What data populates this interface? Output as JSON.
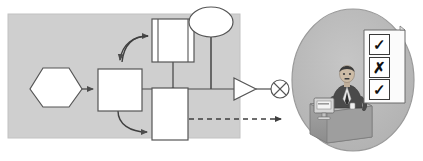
{
  "figure": {
    "background_color": "#ffffff",
    "panel_fill": "#cfcfcf",
    "panel_stroke": "#c4c4c4",
    "shape_fill": "#ffffff",
    "shape_stroke": "#555555",
    "connector_color": "#4d4d4d",
    "scene_fill": "#b9b9b9",
    "scene_stroke": "#8f8f8f"
  },
  "panel": {
    "name": "process-panel",
    "x": 8,
    "y": 14,
    "width": 232,
    "height": 124
  },
  "nodes": {
    "start_hexagon": {
      "label": "",
      "shape": "hexagon",
      "x": 30,
      "y": 68,
      "width": 52,
      "height": 38
    },
    "process_box": {
      "label": "",
      "shape": "rectangle",
      "x": 98,
      "y": 69,
      "width": 44,
      "height": 42
    },
    "document_box": {
      "label": "",
      "shape": "bordered-rectangle",
      "x": 152,
      "y": 19,
      "width": 42,
      "height": 43
    },
    "lower_box": {
      "label": "",
      "shape": "rectangle",
      "x": 152,
      "y": 88,
      "width": 36,
      "height": 52
    },
    "ellipse_node": {
      "label": "",
      "shape": "ellipse",
      "cx": 211,
      "cy": 22,
      "rx": 22,
      "ry": 15
    },
    "triangle_node": {
      "label": "",
      "shape": "triangle",
      "x": 234,
      "y": 78,
      "width": 22,
      "height": 22
    },
    "crossed_circle": {
      "label": "",
      "shape": "circle-with-x",
      "cx": 280,
      "cy": 89,
      "r": 9
    }
  },
  "connectors": [
    {
      "name": "hexagon-to-process",
      "style": "solid",
      "arrow": true
    },
    {
      "name": "process-to-document",
      "style": "solid-curved",
      "arrow": true
    },
    {
      "name": "document-feedback-to-process",
      "style": "solid-curved",
      "arrow": true
    },
    {
      "name": "process-to-lower-box",
      "style": "solid-curved",
      "arrow": true
    },
    {
      "name": "document-to-bus",
      "style": "solid",
      "arrow": false
    },
    {
      "name": "ellipse-to-bus",
      "style": "solid",
      "arrow": false
    },
    {
      "name": "bus-to-triangle",
      "style": "solid",
      "arrow": false
    },
    {
      "name": "triangle-to-crossed-circle",
      "style": "solid",
      "arrow": false
    },
    {
      "name": "lower-box-to-operator",
      "style": "dashed",
      "arrow": true
    }
  ],
  "scene": {
    "name": "operator-scene",
    "cx": 353,
    "cy": 80,
    "rx": 62,
    "ry": 72,
    "desk": {
      "name": "desk"
    },
    "monitor": {
      "name": "computer-monitor"
    },
    "person": {
      "name": "seated-operator"
    },
    "checklist": {
      "name": "checklist-sheet",
      "items": [
        {
          "mark": "check",
          "glyph": "✓"
        },
        {
          "mark": "cross",
          "glyph": "✗"
        },
        {
          "mark": "check",
          "glyph": "✓"
        }
      ]
    }
  }
}
